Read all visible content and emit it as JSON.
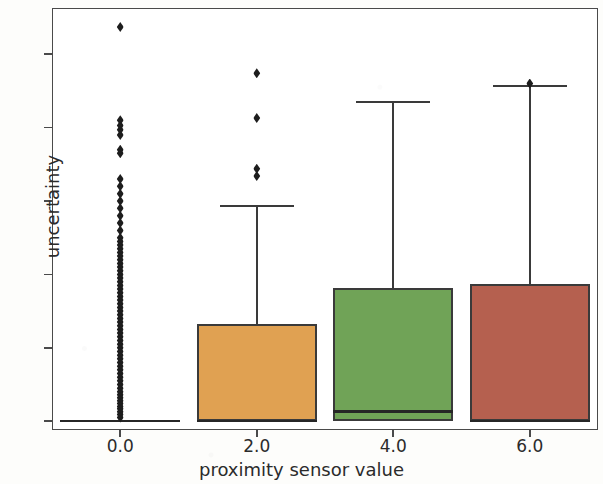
{
  "chart_data": {
    "type": "box",
    "title": "",
    "xlabel": "proximity sensor value",
    "ylabel": "uncertainty",
    "xtick_labels": [
      "0.0",
      "2.0",
      "4.0",
      "6.0"
    ],
    "ytick_labels": [
      "0",
      "1",
      "2",
      "3",
      "4",
      "5"
    ],
    "ylim": [
      -0.12,
      5.63
    ],
    "xlim": [
      -1.0,
      7.0
    ],
    "grid": false,
    "legend": null,
    "categories": [
      0.0,
      2.0,
      4.0,
      6.0
    ],
    "boxes": [
      {
        "category": "0.0",
        "color": "#e0a152",
        "q1": 0.0,
        "median": 0.0,
        "q3": 0.0,
        "whisker_low": 0.0,
        "whisker_high": 0.0,
        "fliers": [
          0.05,
          0.09,
          0.13,
          0.17,
          0.2,
          0.24,
          0.28,
          0.32,
          0.36,
          0.4,
          0.45,
          0.5,
          0.55,
          0.6,
          0.65,
          0.7,
          0.75,
          0.8,
          0.85,
          0.9,
          0.95,
          1.0,
          1.05,
          1.1,
          1.15,
          1.2,
          1.25,
          1.3,
          1.35,
          1.4,
          1.45,
          1.5,
          1.55,
          1.6,
          1.65,
          1.7,
          1.75,
          1.8,
          1.85,
          1.9,
          1.95,
          2.0,
          2.05,
          2.1,
          2.15,
          2.2,
          2.25,
          2.3,
          2.35,
          2.4,
          2.45,
          2.5,
          2.6,
          2.7,
          2.8,
          2.9,
          3.0,
          3.1,
          3.2,
          3.3,
          3.65,
          3.7,
          3.9,
          3.97,
          4.03,
          4.1,
          5.37
        ]
      },
      {
        "category": "2.0",
        "color": "#e0a152",
        "q1": 0.0,
        "median": 0.0,
        "q3": 1.33,
        "whisker_low": 0.0,
        "whisker_high": 2.93,
        "fliers": [
          3.34,
          3.44,
          4.13,
          4.74
        ]
      },
      {
        "category": "4.0",
        "color": "#70a357",
        "q1": 0.0,
        "median": 0.13,
        "q3": 1.82,
        "whisker_low": 0.0,
        "whisker_high": 4.35,
        "fliers": []
      },
      {
        "category": "6.0",
        "color": "#b5604f",
        "q1": 0.0,
        "median": 0.0,
        "q3": 1.87,
        "whisker_low": 0.0,
        "whisker_high": 4.57,
        "fliers": [
          4.6
        ]
      }
    ]
  }
}
